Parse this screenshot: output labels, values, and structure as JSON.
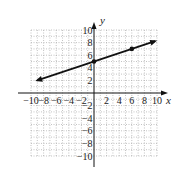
{
  "chart_data": {
    "type": "line",
    "title": "",
    "xlabel": "x",
    "ylabel": "y",
    "xlim": [
      -10,
      10
    ],
    "ylim": [
      -10,
      10
    ],
    "grid": true,
    "grid_style": "dotted",
    "x_ticks": [
      -10,
      -8,
      -6,
      -4,
      -2,
      2,
      4,
      6,
      8,
      10
    ],
    "y_ticks": [
      -10,
      -8,
      -6,
      -4,
      -2,
      2,
      4,
      6,
      8,
      10
    ],
    "x_tick_labels": [
      "−10",
      "−8",
      "−6",
      "−4",
      "−2",
      "2",
      "4",
      "6",
      "8",
      "10"
    ],
    "y_tick_labels": [
      "−10",
      "−8",
      "−6",
      "−4",
      "−2",
      "2",
      "4",
      "6",
      "8",
      "10"
    ],
    "series": [
      {
        "name": "line",
        "equation": "y = (1/3)x + 5",
        "points": [
          [
            0,
            5
          ],
          [
            6,
            7
          ]
        ],
        "line_start": [
          -9,
          2
        ],
        "line_end": [
          9.7,
          8.23
        ],
        "arrows": "both",
        "color": "#111111"
      }
    ]
  },
  "colors": {
    "axis": "#111111",
    "grid": "#9a9a9a",
    "line": "#111111",
    "background": "#ffffff"
  }
}
